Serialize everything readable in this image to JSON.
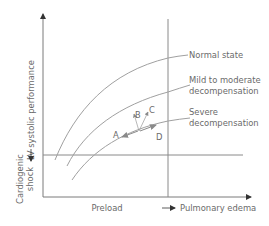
{
  "diagram": {
    "y_axis_label": "LV systolic performance",
    "x_axis_label": "Preload",
    "shock_label_line1": "Cardiogenic",
    "shock_label_line2": "shock",
    "edema_label": "Pulmonary edema",
    "curves": [
      {
        "name": "Normal state",
        "label_lines": [
          "Normal state"
        ]
      },
      {
        "name": "Mild to moderate decompensation",
        "label_lines": [
          "Mild to moderate",
          "decompensation"
        ]
      },
      {
        "name": "Severe decompensation",
        "label_lines": [
          "Severe",
          "decompensation"
        ]
      }
    ],
    "points": {
      "A": "A",
      "B": "B",
      "C": "C",
      "D": "D"
    },
    "colors": {
      "axis": "#7a7a7a",
      "curve": "#9a9a9a",
      "text": "#6a6a6a",
      "arrow": "#8a8a8a"
    }
  }
}
